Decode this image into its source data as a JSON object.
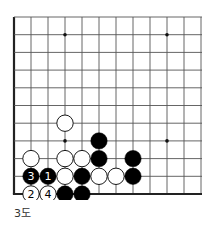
{
  "diagram": {
    "caption": "3도",
    "grid": {
      "cols": 12,
      "rows": 11,
      "origin_x": 14,
      "origin_y": 17,
      "spacing_x": 17,
      "spacing_y": 17.7,
      "thick_edges": [
        "left",
        "bottom"
      ],
      "line_color": "#555555",
      "edge_color": "#222222"
    },
    "star_points": [
      [
        3,
        1
      ],
      [
        9,
        1
      ],
      [
        3,
        7
      ],
      [
        9,
        7
      ]
    ],
    "stones": [
      {
        "col": 3,
        "row": 6,
        "color": "white",
        "label": ""
      },
      {
        "col": 5,
        "row": 7,
        "color": "black",
        "label": ""
      },
      {
        "col": 1,
        "row": 8,
        "color": "white",
        "label": ""
      },
      {
        "col": 3,
        "row": 8,
        "color": "white",
        "label": ""
      },
      {
        "col": 4,
        "row": 8,
        "color": "white",
        "label": ""
      },
      {
        "col": 5,
        "row": 8,
        "color": "black",
        "label": ""
      },
      {
        "col": 7,
        "row": 8,
        "color": "black",
        "label": ""
      },
      {
        "col": 1,
        "row": 9,
        "color": "black",
        "label": "3"
      },
      {
        "col": 2,
        "row": 9,
        "color": "black",
        "label": "1"
      },
      {
        "col": 3,
        "row": 9,
        "color": "white",
        "label": ""
      },
      {
        "col": 4,
        "row": 9,
        "color": "black",
        "label": ""
      },
      {
        "col": 5,
        "row": 9,
        "color": "white",
        "label": ""
      },
      {
        "col": 6,
        "row": 9,
        "color": "white",
        "label": ""
      },
      {
        "col": 7,
        "row": 9,
        "color": "black",
        "label": ""
      },
      {
        "col": 1,
        "row": 10,
        "color": "white",
        "label": "2"
      },
      {
        "col": 2,
        "row": 10,
        "color": "white",
        "label": "4"
      },
      {
        "col": 3,
        "row": 10,
        "color": "black",
        "label": ""
      },
      {
        "col": 4,
        "row": 10,
        "color": "black",
        "label": ""
      }
    ]
  }
}
